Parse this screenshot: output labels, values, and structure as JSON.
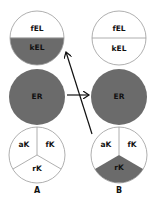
{
  "colors": {
    "fill": "#6b6b6b",
    "empty": "#ffffff",
    "stroke": "#9a9a9a",
    "arrow": "#111111"
  },
  "columns": [
    {
      "label": "A",
      "top": {
        "upper": "fEL",
        "lower": "kEL",
        "upper_filled": false,
        "lower_filled": true
      },
      "middle": {
        "label": "ER",
        "filled": true
      },
      "bottom": {
        "left": "aK",
        "right": "fK",
        "bottom": "rK",
        "filled_segment": "none"
      }
    },
    {
      "label": "B",
      "top": {
        "upper": "fEL",
        "lower": "kEL",
        "upper_filled": false,
        "lower_filled": false
      },
      "middle": {
        "label": "ER",
        "filled": true
      },
      "bottom": {
        "left": "aK",
        "right": "fK",
        "bottom": "rK",
        "filled_segment": "rK"
      }
    }
  ],
  "arrows": [
    {
      "from": "A.ER",
      "to": "B.ER",
      "direction": "right"
    },
    {
      "from": "B.bottom",
      "to": "A.kEL",
      "direction": "up-left"
    }
  ]
}
